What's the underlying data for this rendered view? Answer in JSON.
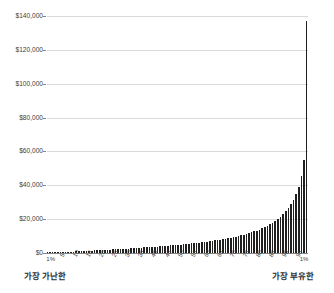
{
  "chart_data": {
    "type": "bar",
    "title": "",
    "subtitle": "",
    "xlabel": "",
    "ylabel": "",
    "ylim": [
      0,
      145000
    ],
    "yticks": [
      0,
      20000,
      40000,
      60000,
      80000,
      100000,
      120000,
      140000
    ],
    "ytick_labels": [
      "$0",
      "$20,000",
      "$40,000",
      "$60,000",
      "$80,000",
      "$100,000",
      "$120,000",
      "$140,000"
    ],
    "grid": true,
    "legend": null,
    "xtick_labels": [
      "1%",
      "5",
      "10",
      "15",
      "20",
      "25",
      "30",
      "35",
      "40",
      "45",
      "50",
      "55",
      "60",
      "65",
      "70",
      "75",
      "80",
      "85",
      "90",
      "95",
      "1%"
    ],
    "xtick_positions": [
      0,
      4,
      9,
      14,
      19,
      24,
      29,
      34,
      39,
      44,
      49,
      54,
      59,
      64,
      69,
      74,
      79,
      84,
      89,
      94,
      99
    ],
    "annotations": {
      "left_caption": "가장 가난한",
      "right_caption": "가장 부유한"
    },
    "categories": [
      "1%",
      "2",
      "3",
      "4",
      "5",
      "6",
      "7",
      "8",
      "9",
      "10",
      "11",
      "12",
      "13",
      "14",
      "15",
      "16",
      "17",
      "18",
      "19",
      "20",
      "21",
      "22",
      "23",
      "24",
      "25",
      "26",
      "27",
      "28",
      "29",
      "30",
      "31",
      "32",
      "33",
      "34",
      "35",
      "36",
      "37",
      "38",
      "39",
      "40",
      "41",
      "42",
      "43",
      "44",
      "45",
      "46",
      "47",
      "48",
      "49",
      "50",
      "51",
      "52",
      "53",
      "54",
      "55",
      "56",
      "57",
      "58",
      "59",
      "60",
      "61",
      "62",
      "63",
      "64",
      "65",
      "66",
      "67",
      "68",
      "69",
      "70",
      "71",
      "72",
      "73",
      "74",
      "75",
      "76",
      "77",
      "78",
      "79",
      "80",
      "81",
      "82",
      "83",
      "84",
      "85",
      "86",
      "87",
      "88",
      "89",
      "90",
      "91",
      "92",
      "93",
      "94",
      "95",
      "96",
      "97",
      "98",
      "99",
      "1%"
    ],
    "values": [
      120,
      180,
      240,
      300,
      360,
      430,
      500,
      580,
      660,
      750,
      840,
      930,
      1020,
      1110,
      1200,
      1290,
      1380,
      1470,
      1560,
      1650,
      1740,
      1830,
      1920,
      2010,
      2100,
      2190,
      2280,
      2370,
      2460,
      2560,
      2660,
      2760,
      2860,
      2960,
      3060,
      3160,
      3270,
      3380,
      3490,
      3600,
      3710,
      3830,
      3950,
      4070,
      4200,
      4330,
      4460,
      4600,
      4740,
      4880,
      5030,
      5180,
      5340,
      5500,
      5670,
      5840,
      6020,
      6200,
      6390,
      6590,
      6800,
      7010,
      7230,
      7460,
      7700,
      7950,
      8210,
      8480,
      8760,
      9060,
      9370,
      9700,
      10050,
      10420,
      10810,
      11220,
      11660,
      12130,
      12630,
      13170,
      13750,
      14380,
      15060,
      15800,
      16610,
      17500,
      18480,
      19570,
      20790,
      22160,
      23700,
      25450,
      27450,
      29750,
      32450,
      35900,
      40500,
      47000,
      57000,
      142000
    ],
    "colors": {
      "bar": "#1f1f1f",
      "grid": "#d9d9d9",
      "axis": "#868686",
      "text": "#3d3d3d",
      "background": "#ffffff"
    }
  }
}
